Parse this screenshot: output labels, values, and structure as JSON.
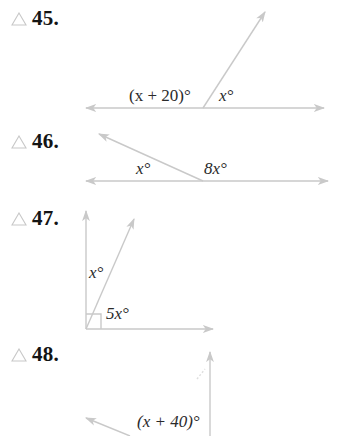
{
  "colors": {
    "line": "#c9c9c9",
    "triangle_icon": "#c8c8c8",
    "number_text": "#141414",
    "label_text": "#2a2a2a"
  },
  "problems": [
    {
      "number": "45.",
      "icon": "triangle-icon",
      "labels": [
        "(x + 20)°",
        "x°"
      ]
    },
    {
      "number": "46.",
      "icon": "triangle-icon",
      "labels": [
        "x°",
        "8x°"
      ]
    },
    {
      "number": "47.",
      "icon": "triangle-icon",
      "labels": [
        "x°",
        "5x°"
      ],
      "right_angle_marker": true
    },
    {
      "number": "48.",
      "icon": "triangle-icon",
      "labels": [
        "(x + 40)°"
      ]
    }
  ]
}
